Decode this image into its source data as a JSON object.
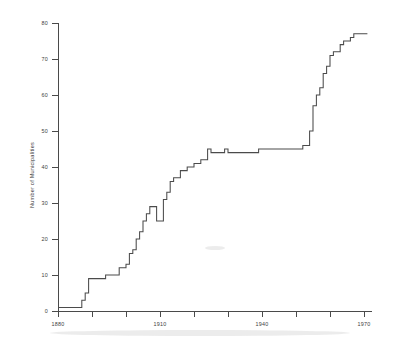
{
  "chart_data": {
    "type": "line",
    "title": "",
    "subtitle": "",
    "xlabel": "",
    "ylabel": "Number of Municipalities",
    "xlim": [
      1880,
      1971
    ],
    "ylim": [
      0,
      82
    ],
    "grid": false,
    "legend": null,
    "step_mode": "post",
    "x_ticks_major": [
      1880,
      1910,
      1940,
      1970
    ],
    "x_tick_labels": [
      "1880",
      "1910",
      "1940",
      "1970"
    ],
    "x_ticks_minor": [
      1890,
      1900,
      1920,
      1930,
      1950,
      1960
    ],
    "y_ticks": [
      0,
      10,
      20,
      30,
      40,
      50,
      60,
      70,
      80
    ],
    "y_tick_labels": [
      "0",
      "10",
      "20",
      "30",
      "40",
      "50",
      "60",
      "70",
      "80"
    ],
    "series": [
      {
        "name": "Cumulative municipalities",
        "x": [
          1880,
          1886,
          1887,
          1888,
          1889,
          1890,
          1894,
          1897,
          1898,
          1900,
          1901,
          1902,
          1903,
          1904,
          1905,
          1906,
          1907,
          1908,
          1909,
          1910,
          1911,
          1912,
          1913,
          1914,
          1915,
          1916,
          1918,
          1920,
          1922,
          1924,
          1925,
          1926,
          1929,
          1930,
          1932,
          1933,
          1936,
          1937,
          1939,
          1940,
          1950,
          1952,
          1953,
          1954,
          1955,
          1956,
          1957,
          1958,
          1959,
          1960,
          1961,
          1963,
          1964,
          1966,
          1967,
          1971
        ],
        "y": [
          1,
          1,
          3,
          5,
          9,
          9,
          10,
          10,
          12,
          13,
          16,
          17,
          20,
          22,
          25,
          27,
          29,
          29,
          25,
          25,
          31,
          33,
          36,
          37,
          37,
          39,
          40,
          41,
          42,
          45,
          44,
          44,
          45,
          44,
          44,
          44,
          44,
          44,
          45,
          45,
          45,
          46,
          46,
          50,
          57,
          60,
          62,
          66,
          68,
          71,
          72,
          74,
          75,
          76,
          77,
          77
        ],
        "min_value": 1,
        "max_value": 77,
        "start_year": 1880,
        "end_year": 1971
      }
    ],
    "annotations": []
  },
  "axes": {
    "y_axis_label": "Number of Municipalities",
    "x_axis_label": ""
  },
  "colors": {
    "line": "#4b4b4b",
    "axis": "#4a4a4a",
    "text": "#3d3d3d",
    "background": "#ffffff"
  }
}
